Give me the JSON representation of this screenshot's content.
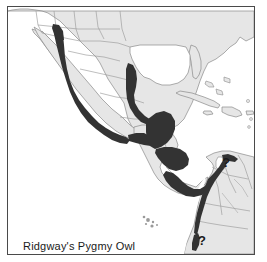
{
  "figure": {
    "type": "range-distribution-map",
    "caption": "Ridgway's Pygmy Owl",
    "region": "Southwestern North America, Mexico, Central America and northern South America"
  },
  "colors": {
    "range_fill": "#333333",
    "land_fill": "#e6e6e6",
    "water_fill": "#ffffff",
    "coastline": "#8a8a8a",
    "country_border": "#9a9a9a",
    "frame": "#4a4a4a",
    "caption_text": "#1a1a1a"
  },
  "legend": {
    "range_label": "breeding / resident range",
    "uncertain_label": "?"
  },
  "annotations": [
    {
      "name": "uncertain-range-venezuela",
      "label": "?"
    },
    {
      "name": "uncertain-range-ecuador",
      "label": "?"
    }
  ],
  "landmasses": [
    "United States",
    "Mexico",
    "Baja California",
    "Guatemala",
    "Belize",
    "Honduras",
    "El Salvador",
    "Nicaragua",
    "Costa Rica",
    "Panama",
    "Colombia",
    "Venezuela",
    "Ecuador",
    "Cuba",
    "Hispaniola",
    "Jamaica",
    "Puerto Rico",
    "Bahamas",
    "Galapagos Islands"
  ],
  "water_bodies": [
    "Pacific Ocean",
    "Gulf of Mexico",
    "Caribbean Sea",
    "Atlantic Ocean",
    "Gulf of California"
  ]
}
